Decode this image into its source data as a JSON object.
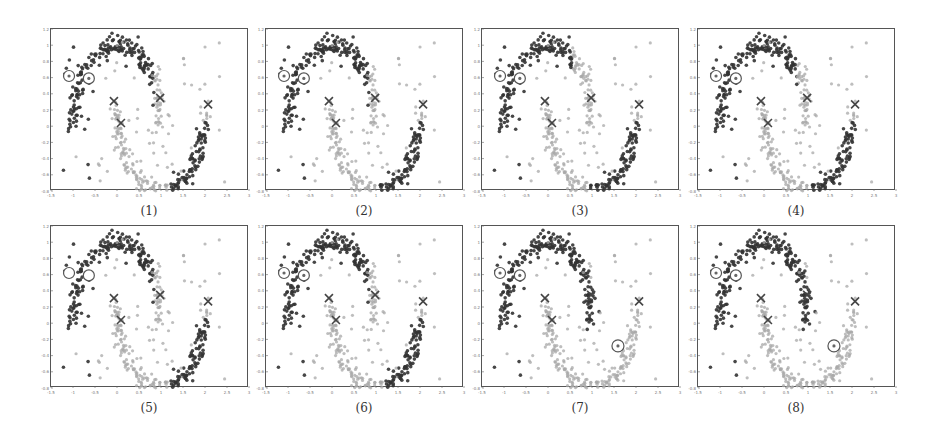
{
  "chart_data": {
    "type": "scatter",
    "title": "",
    "xlabel": "",
    "ylabel": "",
    "xlim": [
      -1.5,
      3
    ],
    "ylim": [
      -0.8,
      1.2
    ],
    "xticks": [
      "-1.5",
      "-1",
      "-0.5",
      "0",
      "0.5",
      "1",
      "1.5",
      "2",
      "2.5",
      "3"
    ],
    "yticks": [
      "1.2",
      "1",
      "0.8",
      "0.6",
      "0.4",
      "0.2",
      "0",
      "-0.2",
      "-0.4",
      "-0.6",
      "-0.8"
    ],
    "grid": false,
    "legend": null,
    "dataset": "two-moons with uniform background noise",
    "colors": {
      "class_dark": "#333333",
      "class_light": "#a8a8a8",
      "frame": "#555555"
    },
    "markers": {
      "cross_centers": [
        {
          "x": -0.07,
          "y": 0.31
        },
        {
          "x": 0.09,
          "y": 0.04
        },
        {
          "x": 0.98,
          "y": 0.35
        },
        {
          "x": 2.07,
          "y": 0.27
        }
      ],
      "labeled_circles_top": [
        {
          "x": -1.09,
          "y": 0.62
        },
        {
          "x": -0.64,
          "y": 0.59
        }
      ],
      "labeled_circle_bottom": {
        "x": 1.59,
        "y": -0.28
      }
    },
    "panels": [
      {
        "id": 1,
        "caption": "(1)",
        "dark_upper_until_x": 0.85,
        "dark_lower_from_x": 1.15,
        "bottom_circle": false,
        "plain_circles": false
      },
      {
        "id": 2,
        "caption": "(2)",
        "dark_upper_until_x": 0.85,
        "dark_lower_from_x": 1.05,
        "bottom_circle": false,
        "plain_circles": false
      },
      {
        "id": 3,
        "caption": "(3)",
        "dark_upper_until_x": 0.55,
        "dark_lower_from_x": 0.95,
        "bottom_circle": false,
        "plain_circles": false
      },
      {
        "id": 4,
        "caption": "(4)",
        "dark_upper_until_x": 0.75,
        "dark_lower_from_x": 1.1,
        "bottom_circle": false,
        "plain_circles": false
      },
      {
        "id": 5,
        "caption": "(5)",
        "dark_upper_until_x": 0.85,
        "dark_lower_from_x": 1.15,
        "bottom_circle": false,
        "plain_circles": true
      },
      {
        "id": 6,
        "caption": "(6)",
        "dark_upper_until_x": 0.85,
        "dark_lower_from_x": 1.2,
        "bottom_circle": false,
        "plain_circles": false
      },
      {
        "id": 7,
        "caption": "(7)",
        "dark_upper_until_x": 1.35,
        "dark_lower_from_x": 99,
        "bottom_circle": true,
        "plain_circles": false
      },
      {
        "id": 8,
        "caption": "(8)",
        "dark_upper_until_x": 1.55,
        "dark_lower_from_x": 99,
        "bottom_circle": true,
        "plain_circles": false
      }
    ],
    "generation": {
      "seed": 7,
      "moon_points": 220,
      "noise_points": 70,
      "jitter": 0.07
    }
  }
}
